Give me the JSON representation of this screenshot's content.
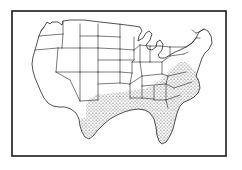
{
  "figure": {
    "kind": "map-figure",
    "caption": "",
    "border": {
      "visible": true,
      "color": "#1a1a1a",
      "x": 12,
      "y": 11,
      "width": 214,
      "height": 145
    },
    "background_color": "#ffffff",
    "line_color": "#2b2b2b",
    "stipple": {
      "pattern": "dots",
      "dot_color": "#1f1f1f",
      "dot_radius": 0.55,
      "spacing": 3.4,
      "label": "shaded region"
    }
  },
  "map": {
    "subject": "contiguous United States",
    "projection_note": "hand-drawn outline",
    "regions": [
      {
        "name": "washington",
        "shaded": false
      },
      {
        "name": "oregon",
        "shaded": false
      },
      {
        "name": "california",
        "shaded": false
      },
      {
        "name": "nevada",
        "shaded": false
      },
      {
        "name": "idaho",
        "shaded": false
      },
      {
        "name": "montana",
        "shaded": false
      },
      {
        "name": "wyoming",
        "shaded": false
      },
      {
        "name": "utah",
        "shaded": false
      },
      {
        "name": "arizona",
        "shaded": false
      },
      {
        "name": "colorado",
        "shaded": false
      },
      {
        "name": "new-mexico",
        "shaded": false
      },
      {
        "name": "north-dakota",
        "shaded": false
      },
      {
        "name": "south-dakota",
        "shaded": false
      },
      {
        "name": "nebraska",
        "shaded": false
      },
      {
        "name": "kansas",
        "shaded": false
      },
      {
        "name": "minnesota",
        "shaded": false
      },
      {
        "name": "iowa",
        "shaded": false
      },
      {
        "name": "missouri",
        "shaded": false
      },
      {
        "name": "wisconsin",
        "shaded": false
      },
      {
        "name": "illinois",
        "shaded": false
      },
      {
        "name": "michigan",
        "shaded": false
      },
      {
        "name": "indiana",
        "shaded": false
      },
      {
        "name": "ohio",
        "shaded": false
      },
      {
        "name": "pennsylvania",
        "shaded": false
      },
      {
        "name": "new-york",
        "shaded": false
      },
      {
        "name": "vermont",
        "shaded": false
      },
      {
        "name": "new-hampshire",
        "shaded": false
      },
      {
        "name": "maine",
        "shaded": false
      },
      {
        "name": "massachusetts",
        "shaded": false
      },
      {
        "name": "connecticut",
        "shaded": false
      },
      {
        "name": "rhode-island",
        "shaded": false
      },
      {
        "name": "new-jersey",
        "shaded": false
      },
      {
        "name": "delaware",
        "shaded": false
      },
      {
        "name": "maryland",
        "shaded": false
      },
      {
        "name": "west-virginia",
        "shaded": false
      },
      {
        "name": "kentucky",
        "shaded": true
      },
      {
        "name": "virginia",
        "shaded": true
      },
      {
        "name": "north-carolina",
        "shaded": true
      },
      {
        "name": "south-carolina",
        "shaded": true
      },
      {
        "name": "georgia",
        "shaded": true
      },
      {
        "name": "florida",
        "shaded": true
      },
      {
        "name": "alabama",
        "shaded": true
      },
      {
        "name": "mississippi",
        "shaded": true
      },
      {
        "name": "tennessee",
        "shaded": true
      },
      {
        "name": "arkansas",
        "shaded": true
      },
      {
        "name": "louisiana",
        "shaded": true
      },
      {
        "name": "oklahoma",
        "shaded": true
      },
      {
        "name": "texas",
        "shaded": true
      }
    ]
  }
}
